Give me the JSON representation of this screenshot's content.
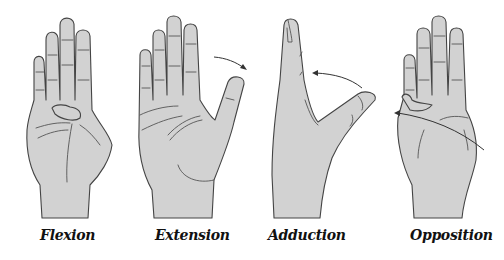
{
  "figure": {
    "panels": [
      {
        "label": "Flexion",
        "motion": "thumb flexed across palm"
      },
      {
        "label": "Extension",
        "motion": "thumb extended away from palm",
        "arrow": "outward"
      },
      {
        "label": "Adduction",
        "motion": "thumb brought toward index finger (side view)",
        "arrow": "inward"
      },
      {
        "label": "Opposition",
        "motion": "thumb tip across palm toward little finger",
        "arrow": "across palm"
      }
    ],
    "colors": {
      "skin_fill": "#d2d2d2",
      "outline": "#444444",
      "background": "#ffffff"
    }
  }
}
